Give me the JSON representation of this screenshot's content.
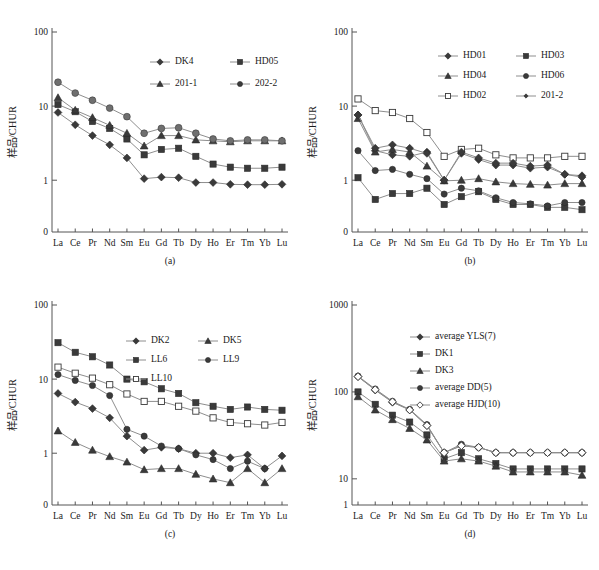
{
  "figure": {
    "top_cut_text": "",
    "y_axis_label": "样品/CHUR",
    "elements": [
      "La",
      "Ce",
      "Pr",
      "Nd",
      "Sm",
      "Eu",
      "Gd",
      "Tb",
      "Dy",
      "Ho",
      "Er",
      "Tm",
      "Yb",
      "Lu"
    ],
    "captions": {
      "a": "(a)",
      "b": "(b)",
      "c": "(c)",
      "d": "(d)"
    }
  },
  "chart_data": [
    {
      "panel": "a",
      "type": "line",
      "title": "(a)",
      "xlabel": "",
      "ylabel": "样品/CHUR",
      "yscale": "log",
      "ylim": [
        0.2,
        100
      ],
      "yticks": [
        100,
        10,
        1
      ],
      "ytick_labels": [
        "100",
        "10",
        "1",
        "0"
      ],
      "categories": [
        "La",
        "Ce",
        "Pr",
        "Nd",
        "Sm",
        "Eu",
        "Gd",
        "Tb",
        "Dy",
        "Ho",
        "Er",
        "Tm",
        "Yb",
        "Lu"
      ],
      "legend_position": "upper-right",
      "series": [
        {
          "name": "DK4",
          "marker": "diamond",
          "fill": "solid",
          "values": [
            8.2,
            5.6,
            4.0,
            3.0,
            2.0,
            1.05,
            1.1,
            1.08,
            0.93,
            0.93,
            0.88,
            0.87,
            0.87,
            0.88
          ]
        },
        {
          "name": "HD05",
          "marker": "square",
          "fill": "solid",
          "values": [
            10.5,
            8.4,
            6.2,
            5.0,
            3.6,
            2.2,
            2.6,
            2.7,
            2.1,
            1.65,
            1.5,
            1.45,
            1.45,
            1.5
          ]
        },
        {
          "name": "201-1",
          "marker": "triangle",
          "fill": "solid",
          "values": [
            13.0,
            8.8,
            7.0,
            5.5,
            4.3,
            2.9,
            4.0,
            4.0,
            3.5,
            3.4,
            3.3,
            3.4,
            3.4,
            3.4
          ]
        },
        {
          "name": "202-2",
          "marker": "circle",
          "fill": "gray",
          "values": [
            21.0,
            15.0,
            12.0,
            9.4,
            7.2,
            4.3,
            5.0,
            5.1,
            4.3,
            3.6,
            3.4,
            3.5,
            3.5,
            3.4
          ]
        }
      ]
    },
    {
      "panel": "b",
      "type": "line",
      "title": "(b)",
      "xlabel": "",
      "ylabel": "样品/CHUR",
      "yscale": "log",
      "ylim": [
        0.2,
        100
      ],
      "yticks": [
        100,
        10,
        1
      ],
      "ytick_labels": [
        "100",
        "10",
        "1",
        "0"
      ],
      "categories": [
        "La",
        "Ce",
        "Pr",
        "Nd",
        "Sm",
        "Eu",
        "Gd",
        "Tb",
        "Dy",
        "Ho",
        "Er",
        "Tm",
        "Yb",
        "Lu"
      ],
      "legend_position": "upper-right",
      "series": [
        {
          "name": "HD01",
          "marker": "diamond",
          "fill": "solid",
          "values": [
            7.6,
            2.5,
            2.2,
            2.1,
            2.4,
            1.0,
            2.3,
            1.9,
            1.6,
            1.6,
            1.45,
            1.5,
            1.2,
            1.15
          ]
        },
        {
          "name": "HD03",
          "marker": "square",
          "fill": "solid",
          "values": [
            1.08,
            0.55,
            0.66,
            0.66,
            0.78,
            0.47,
            0.6,
            0.7,
            0.55,
            0.47,
            0.47,
            0.43,
            0.43,
            0.4
          ]
        },
        {
          "name": "HD04",
          "marker": "triangle",
          "fill": "solid",
          "values": [
            6.8,
            2.4,
            2.6,
            2.4,
            1.55,
            0.98,
            1.0,
            1.05,
            0.95,
            0.9,
            0.88,
            0.86,
            0.9,
            0.9
          ]
        },
        {
          "name": "HD06",
          "marker": "circle",
          "fill": "solid",
          "values": [
            2.5,
            1.35,
            1.4,
            1.2,
            1.05,
            0.65,
            0.78,
            0.72,
            0.58,
            0.5,
            0.48,
            0.45,
            0.5,
            0.5
          ]
        },
        {
          "name": "HD02",
          "marker": "square",
          "fill": "open",
          "values": [
            12.5,
            8.7,
            8.2,
            6.8,
            4.4,
            2.1,
            2.6,
            2.7,
            2.2,
            2.0,
            2.0,
            2.0,
            2.1,
            2.1
          ]
        },
        {
          "name": "201-2",
          "marker": "diamond",
          "fill": "solid",
          "values": [
            7.6,
            2.7,
            3.0,
            2.7,
            2.3,
            1.0,
            2.4,
            2.0,
            1.7,
            1.7,
            1.55,
            1.6,
            1.2,
            1.1
          ]
        }
      ]
    },
    {
      "panel": "c",
      "type": "line",
      "title": "(c)",
      "xlabel": "",
      "ylabel": "样品/CHUR",
      "yscale": "log",
      "ylim": [
        0.2,
        100
      ],
      "yticks": [
        100,
        10,
        1
      ],
      "ytick_labels": [
        "100",
        "10",
        "1",
        "0"
      ],
      "categories": [
        "La",
        "Ce",
        "Pr",
        "Nd",
        "Sm",
        "Eu",
        "Gd",
        "Tb",
        "Dy",
        "Ho",
        "Er",
        "Tm",
        "Yb",
        "Lu"
      ],
      "legend_position": "upper-center",
      "series": [
        {
          "name": "DK2",
          "marker": "diamond",
          "fill": "solid",
          "values": [
            6.4,
            4.9,
            4.0,
            3.0,
            1.7,
            1.1,
            1.2,
            1.15,
            1.0,
            1.0,
            0.87,
            0.95,
            0.62,
            0.92
          ]
        },
        {
          "name": "DK5",
          "marker": "triangle",
          "fill": "solid",
          "values": [
            2.0,
            1.4,
            1.1,
            0.9,
            0.76,
            0.6,
            0.62,
            0.62,
            0.52,
            0.45,
            0.4,
            0.62,
            0.4,
            0.62
          ]
        },
        {
          "name": "LL6",
          "marker": "square",
          "fill": "solid",
          "values": [
            31.0,
            23.0,
            20.0,
            15.5,
            10.0,
            9.2,
            7.4,
            6.4,
            4.8,
            4.3,
            3.9,
            4.2,
            3.9,
            3.8
          ]
        },
        {
          "name": "LL9",
          "marker": "circle",
          "fill": "solid",
          "values": [
            11.5,
            9.6,
            8.2,
            6.0,
            2.1,
            1.7,
            1.25,
            1.15,
            0.95,
            0.82,
            0.62,
            0.78,
            0.62
          ]
        },
        {
          "name": "LL10",
          "marker": "square",
          "fill": "open",
          "values": [
            14.5,
            12.0,
            10.3,
            8.4,
            6.3,
            5.0,
            5.0,
            4.3,
            3.7,
            3.0,
            2.6,
            2.5,
            2.4,
            2.6
          ]
        }
      ]
    },
    {
      "panel": "d",
      "type": "line",
      "title": "(d)",
      "xlabel": "",
      "ylabel": "样品/CHUR",
      "yscale": "log",
      "ylim": [
        5,
        1000
      ],
      "yticks": [
        1000,
        100,
        10
      ],
      "ytick_labels": [
        "1000",
        "100",
        "10",
        "1"
      ],
      "categories": [
        "La",
        "Ce",
        "Pr",
        "Nd",
        "Sm",
        "Eu",
        "Gd",
        "Tb",
        "Dy",
        "Ho",
        "Er",
        "Tm",
        "Yb",
        "Lu"
      ],
      "legend_position": "upper-center",
      "series": [
        {
          "name": "average YLS(7)",
          "marker": "diamond",
          "fill": "solid",
          "values": [
            150,
            105,
            76,
            62,
            41,
            20,
            24,
            23,
            20,
            20,
            20,
            20,
            20,
            20
          ]
        },
        {
          "name": "DK1",
          "marker": "square",
          "fill": "solid",
          "values": [
            100,
            72,
            54,
            45,
            32,
            17,
            20,
            17,
            15,
            13,
            13,
            13,
            13,
            13
          ]
        },
        {
          "name": "DK3",
          "marker": "triangle",
          "fill": "solid",
          "values": [
            88,
            62,
            48,
            38,
            28,
            16,
            17,
            16,
            14,
            12,
            12,
            12,
            12,
            11
          ]
        },
        {
          "name": "average DD(5)",
          "marker": "circle",
          "fill": "solid",
          "values": [
            152,
            108,
            78,
            63,
            42,
            20,
            25,
            23,
            20,
            20,
            20,
            20,
            20,
            20
          ]
        },
        {
          "name": "average HJD(10)",
          "marker": "diamond",
          "fill": "open",
          "values": [
            150,
            106,
            77,
            62,
            41,
            20,
            24,
            23,
            20,
            20,
            20,
            20,
            20,
            20
          ]
        }
      ]
    }
  ],
  "legends": {
    "a": [
      {
        "label": "DK4",
        "marker": "diamond"
      },
      {
        "label": "HD05",
        "marker": "square"
      },
      {
        "label": "201-1",
        "marker": "triangle"
      },
      {
        "label": "202-2",
        "marker": "circle"
      }
    ],
    "b": [
      {
        "label": "HD01",
        "marker": "diamond"
      },
      {
        "label": "HD03",
        "marker": "square"
      },
      {
        "label": "HD04",
        "marker": "triangle"
      },
      {
        "label": "HD06",
        "marker": "circle"
      },
      {
        "label": "HD02",
        "marker": "square-open"
      },
      {
        "label": "201-2",
        "marker": "diamond-small"
      }
    ],
    "c": [
      {
        "label": "DK2",
        "marker": "diamond"
      },
      {
        "label": "DK5",
        "marker": "triangle"
      },
      {
        "label": "LL6",
        "marker": "square"
      },
      {
        "label": "LL9",
        "marker": "circle"
      },
      {
        "label": "LL10",
        "marker": "square-open"
      }
    ],
    "d": [
      {
        "label": "average YLS(7)",
        "marker": "diamond"
      },
      {
        "label": "DK1",
        "marker": "square"
      },
      {
        "label": "DK3",
        "marker": "triangle"
      },
      {
        "label": "average DD(5)",
        "marker": "circle"
      },
      {
        "label": "average HJD(10)",
        "marker": "diamond-open"
      }
    ]
  },
  "colors": {
    "marker_fill": "#3a3a3a",
    "marker_gray": "#6f6f6f",
    "line": "#8e8e8e",
    "axis": "#555555",
    "text": "#1a1a1a",
    "background": "#ffffff"
  }
}
